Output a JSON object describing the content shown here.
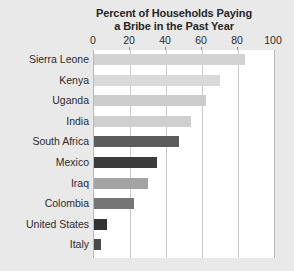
{
  "chart_data": {
    "type": "bar",
    "orientation": "horizontal",
    "title": "Percent of Households Paying a Bribe in the Past Year",
    "title_lines": [
      "Percent of Households Paying",
      "a Bribe in the Past Year"
    ],
    "xlabel": "",
    "ylabel": "",
    "xlim": [
      0,
      100
    ],
    "xticks": [
      0,
      20,
      40,
      60,
      80,
      100
    ],
    "xtick_labels": [
      "0",
      "20",
      "40",
      "60",
      "80",
      "100"
    ],
    "grid": true,
    "grid_axis": "x",
    "legend": false,
    "categories": [
      "Sierra Leone",
      "Kenya",
      "Uganda",
      "India",
      "South Africa",
      "Mexico",
      "Iraq",
      "Colombia",
      "United States",
      "Italy"
    ],
    "values": [
      84,
      70,
      62,
      54,
      47,
      35,
      30,
      22,
      7,
      4
    ],
    "bar_colors": [
      "#d3d3d3",
      "#d9d9d9",
      "#cccccc",
      "#cfcfcf",
      "#5c5c5c",
      "#3b3b3b",
      "#a3a3a3",
      "#757575",
      "#333333",
      "#4a4a4a"
    ]
  },
  "figure": {
    "background_color": "#e9e9e9",
    "plot_background_color": "#ffffff",
    "gridline_color": "#c9c9c9",
    "text_color": "#2b2b2b"
  }
}
